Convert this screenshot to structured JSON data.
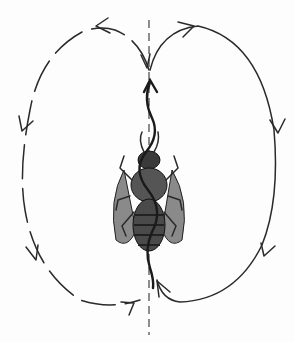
{
  "figure": {
    "elements": [
      "vertical-axis",
      "waggle-run",
      "left-return-loop",
      "right-return-loop",
      "bee"
    ],
    "colors": {
      "ink": "#2a2a2a",
      "background": "#fdfdfd"
    }
  }
}
